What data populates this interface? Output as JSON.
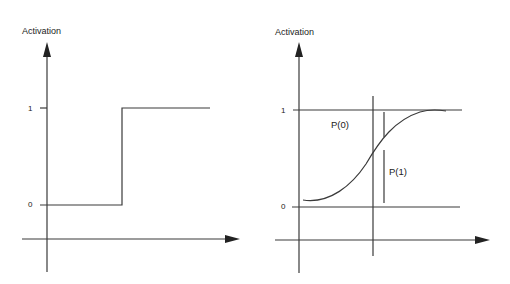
{
  "left_plot": {
    "title": "Step Activation Function",
    "y_axis_label": "Activation",
    "tick_one": "1",
    "tick_zero": "0"
  },
  "right_plot": {
    "title": "Sigmoid Activation Function",
    "y_axis_label": "Activation",
    "tick_one": "1",
    "tick_zero": "0",
    "label_p0": "P(0)",
    "label_p1": "P(1)"
  },
  "colors": {
    "line": "#333333",
    "background": "#ffffff"
  }
}
